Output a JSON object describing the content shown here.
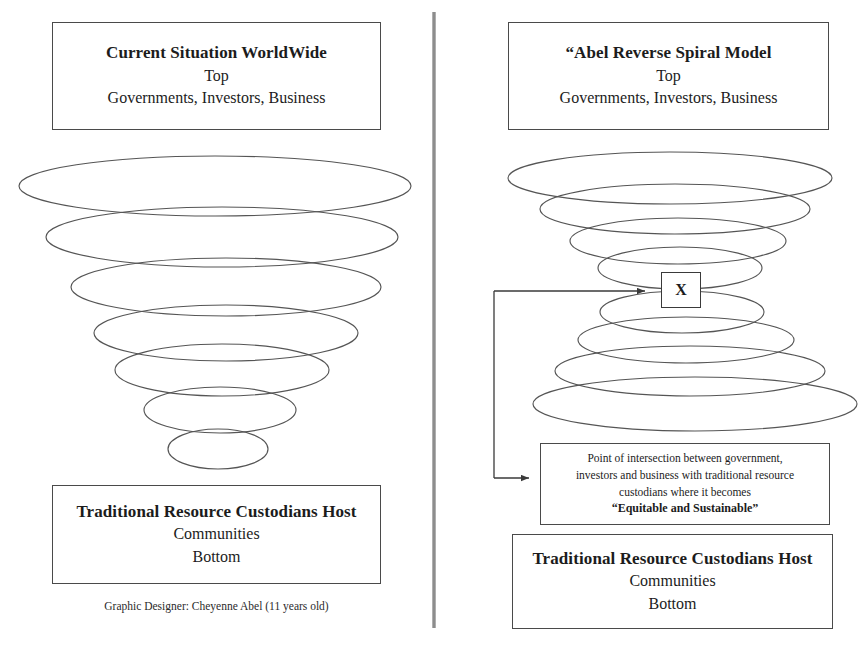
{
  "diagram": {
    "title": "Abel Reverse Spiral Model",
    "divider": {
      "name": "vertical-divider",
      "color": "#8d8d8d"
    },
    "stroke_color": "#4a4a4a"
  },
  "left_panel": {
    "title_box": {
      "heading": "Current Situation WorldWide",
      "line2": "Top",
      "line3": "Governments, Investors, Business"
    },
    "bottom_box": {
      "heading": "Traditional Resource Custodians Host",
      "line2": "Communities",
      "line3": "Bottom"
    },
    "credit": "Graphic Designer: Cheyenne Abel (11 years old)",
    "spiral": {
      "shape": "funnel",
      "ellipses": [
        {
          "cx": 215,
          "cy": 186,
          "rx": 196,
          "ry": 30
        },
        {
          "cx": 222,
          "cy": 237,
          "rx": 176,
          "ry": 30
        },
        {
          "cx": 226,
          "cy": 287,
          "rx": 155,
          "ry": 29
        },
        {
          "cx": 226,
          "cy": 333,
          "rx": 132,
          "ry": 28
        },
        {
          "cx": 222,
          "cy": 370,
          "rx": 107,
          "ry": 26
        },
        {
          "cx": 220,
          "cy": 410,
          "rx": 76,
          "ry": 23
        },
        {
          "cx": 218,
          "cy": 449,
          "rx": 50,
          "ry": 20
        }
      ]
    }
  },
  "right_panel": {
    "title_box": {
      "heading": "“Abel Reverse Spiral Model",
      "line2": "Top",
      "line3": "Governments, Investors, Business"
    },
    "bottom_box": {
      "heading": "Traditional Resource Custodians Host",
      "line2": "Communities",
      "line3": "Bottom"
    },
    "note_box": {
      "lines": [
        "Point of intersection between government,",
        "investors and business with traditional resource",
        "custodians where it becomes"
      ],
      "emphasis": "“Equitable and Sustainable”"
    },
    "intersection_marker": {
      "label": "X"
    },
    "spiral": {
      "shape": "hourglass",
      "ellipses": [
        {
          "cx": 670,
          "cy": 178,
          "rx": 162,
          "ry": 26
        },
        {
          "cx": 675,
          "cy": 209,
          "rx": 135,
          "ry": 25
        },
        {
          "cx": 678,
          "cy": 241,
          "rx": 108,
          "ry": 23
        },
        {
          "cx": 680,
          "cy": 268,
          "rx": 82,
          "ry": 21
        },
        {
          "cx": 682,
          "cy": 312,
          "rx": 82,
          "ry": 21
        },
        {
          "cx": 686,
          "cy": 340,
          "rx": 108,
          "ry": 23
        },
        {
          "cx": 690,
          "cy": 371,
          "rx": 135,
          "ry": 25
        },
        {
          "cx": 695,
          "cy": 404,
          "rx": 162,
          "ry": 27
        }
      ]
    },
    "connector": {
      "name": "intersection-connector",
      "description": "bracket with arrowheads pointing right at the X marker and at the note box"
    }
  }
}
